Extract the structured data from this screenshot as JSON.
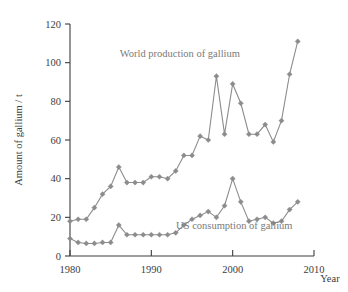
{
  "chart_data": {
    "type": "line",
    "title": "",
    "xlabel": "Year",
    "ylabel": "Amount of gallium / t",
    "xlim": [
      1980,
      2010
    ],
    "ylim": [
      0,
      120
    ],
    "xticks": [
      1980,
      1990,
      2000,
      2010
    ],
    "yticks": [
      0,
      20,
      40,
      60,
      80,
      100,
      120
    ],
    "grid": false,
    "legend_position": "inline-annotations",
    "x": [
      1980,
      1981,
      1982,
      1983,
      1984,
      1985,
      1986,
      1987,
      1988,
      1989,
      1990,
      1991,
      1992,
      1993,
      1994,
      1995,
      1996,
      1997,
      1998,
      1999,
      2000,
      2001,
      2002,
      2003,
      2004,
      2005,
      2006,
      2007,
      2008
    ],
    "series": [
      {
        "name": "World production of gallium",
        "label": "World production of gallium",
        "color": "#8c8c8c",
        "values": [
          18,
          19,
          19,
          25,
          32,
          36,
          46,
          38,
          38,
          38,
          41,
          41,
          40,
          44,
          52,
          52,
          62,
          60,
          93,
          63,
          89,
          79,
          63,
          63,
          68,
          59,
          70,
          94,
          111
        ]
      },
      {
        "name": "US consumption of gallium",
        "label": "US consumption of gallium",
        "color": "#8c8c8c",
        "values": [
          9,
          7,
          6.5,
          6.5,
          7,
          7,
          16,
          11,
          11,
          11,
          11,
          11,
          11,
          12,
          16,
          19,
          21,
          23,
          20,
          26,
          40,
          28,
          18,
          19,
          20,
          17,
          18,
          24,
          28
        ]
      }
    ],
    "annotations": [
      {
        "text": "World production of gallium",
        "x": 1993.5,
        "y": 103
      },
      {
        "text": "US consumption of gallium",
        "x": 2000.2,
        "y": 14
      }
    ]
  },
  "axis": {
    "y_title": "Amount of gallium / t",
    "x_title": "Year",
    "y_tick_labels": [
      "0",
      "20",
      "40",
      "60",
      "80",
      "100",
      "120"
    ],
    "x_tick_labels": [
      "1980",
      "1990",
      "2000",
      "2010"
    ]
  }
}
